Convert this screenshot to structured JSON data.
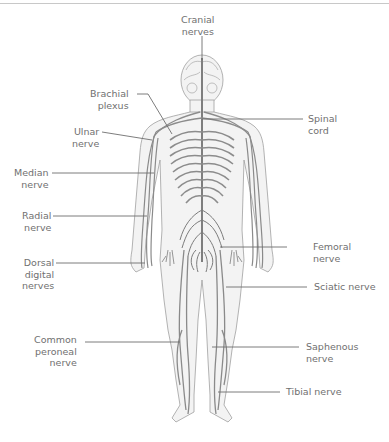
{
  "diagram": {
    "labels": {
      "cranial": [
        "Cranial",
        "nerves"
      ],
      "brachial": [
        "Brachial",
        "plexus"
      ],
      "spinal": [
        "Spinal",
        "cord"
      ],
      "ulnar": [
        "Ulnar",
        "nerve"
      ],
      "median": [
        "Median",
        "nerve"
      ],
      "radial": [
        "Radial",
        "nerve"
      ],
      "dorsal": [
        "Dorsal",
        "digital",
        "nerves"
      ],
      "femoral": [
        "Femoral",
        "nerve"
      ],
      "sciatic": [
        "Sciatic nerve"
      ],
      "peroneal": [
        "Common",
        "peroneal",
        "nerve"
      ],
      "saphenous": [
        "Saphenous",
        "nerve"
      ],
      "tibial": [
        "Tibial nerve"
      ]
    },
    "colors": {
      "nerve": "#8a8a8a",
      "outline": "#9a9a9a",
      "skin": "#f2f2f2",
      "leader": "#6e6e6e",
      "text": "#707070"
    }
  }
}
